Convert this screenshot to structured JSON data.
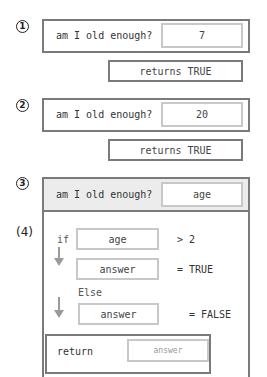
{
  "step1": {
    "marker": "1",
    "question": "am I old enough?",
    "input_value": "7",
    "result": "returns TRUE"
  },
  "step2": {
    "marker": "2",
    "question": "am I old enough?",
    "input_value": "20",
    "result": "returns TRUE"
  },
  "step3": {
    "marker": "3",
    "question": "am I old enough?",
    "input_value": "age"
  },
  "step4": {
    "marker": "(4)",
    "if_keyword": "if",
    "condition_variable": "age",
    "condition_operator": "> 2",
    "then_variable": "answer",
    "then_assignment": "= TRUE",
    "else_keyword": "Else",
    "else_variable": "answer",
    "else_assignment": "= FALSE",
    "return_keyword": "return",
    "return_value": "answer"
  },
  "colors": {
    "outer_border": "#7a7a7a",
    "field_border": "#c8c8c8",
    "header_bg": "#ececec",
    "arrow": "#9a9a9a"
  }
}
